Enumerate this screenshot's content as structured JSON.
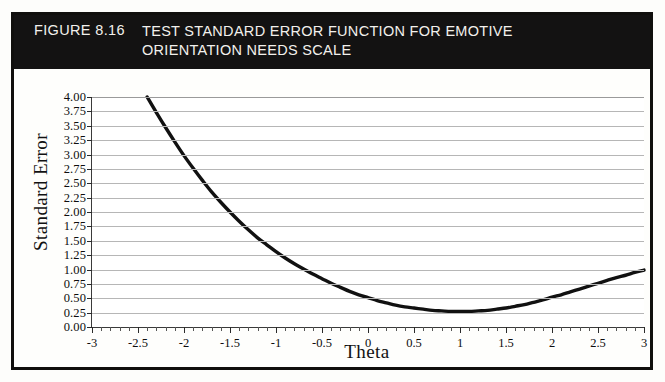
{
  "figure": {
    "number_label": "FIGURE 8.16",
    "title": "TEST STANDARD ERROR FUNCTION FOR EMOTIVE ORIENTATION NEEDS SCALE",
    "banner_bg": "#131212",
    "banner_fg": "#f2f0ec",
    "frame_color": "#100f0d"
  },
  "chart_data": {
    "type": "line",
    "title": "TEST STANDARD ERROR FUNCTION FOR EMOTIVE ORIENTATION NEEDS SCALE",
    "xlabel": "Theta",
    "ylabel": "Standard Error",
    "xlim": [
      -3,
      3
    ],
    "ylim": [
      0.0,
      4.0
    ],
    "grid": true,
    "legend": null,
    "line_color": "#111111",
    "line_width": 3.4,
    "xticks": [
      -3,
      -2.5,
      -2,
      -1.5,
      -1,
      -0.5,
      0,
      0.5,
      1,
      1.5,
      2,
      2.5,
      3
    ],
    "xtick_labels": [
      "-3",
      "-2.5",
      "-2",
      "-1.5",
      "-1",
      "-0.5",
      "0",
      "0.5",
      "1",
      "1.5",
      "2",
      "2.5",
      "3"
    ],
    "x_minor_step": 0.1,
    "yticks": [
      0.0,
      0.25,
      0.5,
      0.75,
      1.0,
      1.25,
      1.5,
      1.75,
      2.0,
      2.25,
      2.5,
      2.75,
      3.0,
      3.25,
      3.5,
      3.75,
      4.0
    ],
    "ytick_labels": [
      "0.00",
      "0.25",
      "0.50",
      "0.75",
      "1.00",
      "1.25",
      "1.50",
      "1.75",
      "2.00",
      "2.25",
      "2.50",
      "2.75",
      "3.00",
      "3.25",
      "3.50",
      "3.75",
      "4.00"
    ],
    "series": [
      {
        "name": "Standard Error",
        "x": [
          -2.4,
          -2.3,
          -2.2,
          -2.1,
          -2.0,
          -1.9,
          -1.8,
          -1.7,
          -1.6,
          -1.5,
          -1.4,
          -1.3,
          -1.2,
          -1.1,
          -1.0,
          -0.9,
          -0.8,
          -0.7,
          -0.6,
          -0.5,
          -0.4,
          -0.3,
          -0.2,
          -0.1,
          0.0,
          0.1,
          0.2,
          0.3,
          0.4,
          0.5,
          0.6,
          0.7,
          0.8,
          0.9,
          1.0,
          1.1,
          1.2,
          1.3,
          1.4,
          1.5,
          1.6,
          1.7,
          1.8,
          1.9,
          2.0,
          2.1,
          2.2,
          2.3,
          2.4,
          2.5,
          2.6,
          2.7,
          2.8,
          2.9,
          3.0
        ],
        "y": [
          4.0,
          3.73,
          3.47,
          3.22,
          2.98,
          2.76,
          2.55,
          2.35,
          2.17,
          2.0,
          1.84,
          1.69,
          1.55,
          1.43,
          1.31,
          1.2,
          1.1,
          1.01,
          0.92,
          0.84,
          0.76,
          0.69,
          0.62,
          0.56,
          0.51,
          0.46,
          0.42,
          0.38,
          0.35,
          0.33,
          0.31,
          0.29,
          0.28,
          0.27,
          0.27,
          0.27,
          0.28,
          0.29,
          0.31,
          0.33,
          0.36,
          0.39,
          0.43,
          0.47,
          0.52,
          0.56,
          0.61,
          0.66,
          0.71,
          0.76,
          0.81,
          0.86,
          0.9,
          0.95,
          0.99
        ]
      }
    ],
    "notes": {
      "minimum_theta": 0.95,
      "minimum_value": 0.27,
      "left_endpoint": "-2.40 at 4.00",
      "right_endpoint": "3.00 at 1.00"
    }
  }
}
